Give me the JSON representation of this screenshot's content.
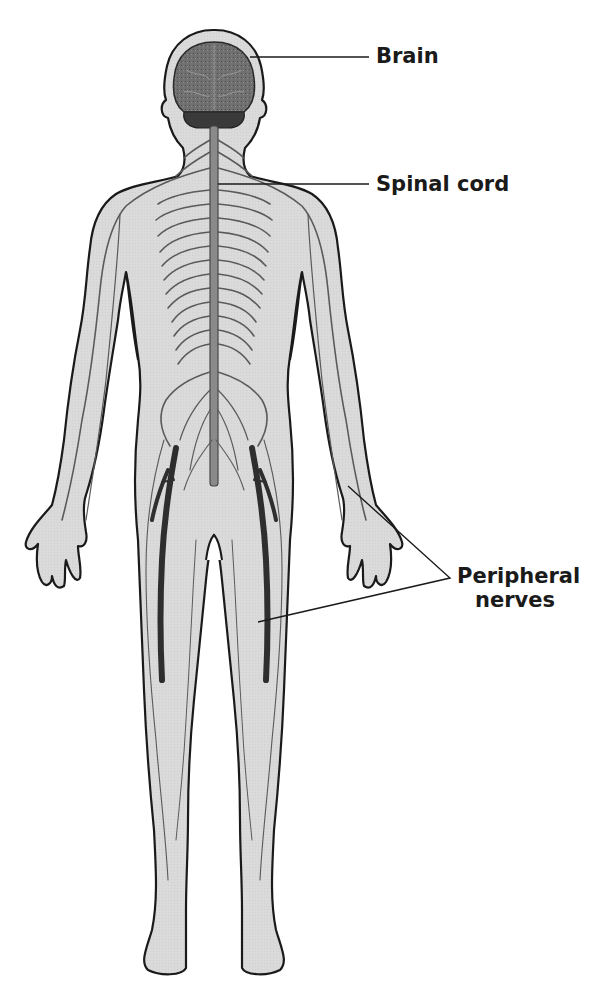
{
  "diagram": {
    "labels": {
      "brain": "Brain",
      "spinal_cord": "Spinal cord",
      "peripheral_line1": "Peripheral",
      "peripheral_line2": "nerves"
    },
    "colors": {
      "background": "#ffffff",
      "body_fill": "#d9d9d9",
      "body_outline": "#1a1a1a",
      "nerve": "#5a5a5a",
      "nerve_dark": "#2e2e2e",
      "brain": "#6b6b6b",
      "cerebellum": "#3a3a3a",
      "leader_line": "#1a1a1a",
      "label_text": "#1a1a1a"
    }
  }
}
